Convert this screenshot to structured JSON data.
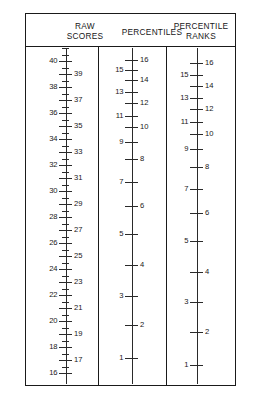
{
  "headers": {
    "raw_scores": "RAW\nSCORES",
    "raw_scores_line1": "RAW",
    "raw_scores_line2": "SCORES",
    "percentiles": "PERCENTILES",
    "percentile_ranks_line1": "PERCENTILE",
    "percentile_ranks_line2": "RANKS"
  },
  "colors": {
    "ink": "#1a1a1a",
    "axis": "#2a2a2a",
    "paper": "#ffffff"
  },
  "chart_data": {
    "type": "table",
    "xlabel": "",
    "ylabel": "",
    "grid": false,
    "legend": "none",
    "scales": [
      {
        "name": "RAW SCORES",
        "axis_x": 39.6,
        "spacing": "linear",
        "range": [
          16,
          40
        ],
        "ticks": [
          {
            "label": "40",
            "y": 60,
            "side": "left",
            "size": "major"
          },
          {
            "label": "",
            "y": 47,
            "side": "none",
            "size": "minor"
          },
          {
            "label": "39",
            "y": 73,
            "side": "right",
            "size": "major"
          },
          {
            "label": "38",
            "y": 86,
            "side": "left",
            "size": "major"
          },
          {
            "label": "37",
            "y": 99,
            "side": "right",
            "size": "major"
          },
          {
            "label": "36",
            "y": 112,
            "side": "left",
            "size": "major"
          },
          {
            "label": "35",
            "y": 125,
            "side": "right",
            "size": "major"
          },
          {
            "label": "34",
            "y": 138,
            "side": "left",
            "size": "major"
          },
          {
            "label": "33",
            "y": 151,
            "side": "right",
            "size": "major"
          },
          {
            "label": "32",
            "y": 164,
            "side": "left",
            "size": "major"
          },
          {
            "label": "31",
            "y": 177,
            "side": "right",
            "size": "major"
          },
          {
            "label": "30",
            "y": 190,
            "side": "left",
            "size": "major"
          },
          {
            "label": "29",
            "y": 203,
            "side": "right",
            "size": "major"
          },
          {
            "label": "28",
            "y": 216,
            "side": "left",
            "size": "major"
          },
          {
            "label": "27",
            "y": 229,
            "side": "right",
            "size": "major"
          },
          {
            "label": "26",
            "y": 242,
            "side": "left",
            "size": "major"
          },
          {
            "label": "25",
            "y": 255,
            "side": "right",
            "size": "major"
          },
          {
            "label": "24",
            "y": 268,
            "side": "left",
            "size": "major"
          },
          {
            "label": "23",
            "y": 281,
            "side": "right",
            "size": "major"
          },
          {
            "label": "22",
            "y": 294,
            "side": "left",
            "size": "major"
          },
          {
            "label": "21",
            "y": 307,
            "side": "right",
            "size": "major"
          },
          {
            "label": "20",
            "y": 320,
            "side": "left",
            "size": "major"
          },
          {
            "label": "19",
            "y": 333,
            "side": "right",
            "size": "major"
          },
          {
            "label": "18",
            "y": 346,
            "side": "left",
            "size": "major"
          },
          {
            "label": "17",
            "y": 359,
            "side": "right",
            "size": "major"
          },
          {
            "label": "16",
            "y": 372,
            "side": "left",
            "size": "major"
          }
        ]
      },
      {
        "name": "PERCENTILES",
        "axis_x": 105.6,
        "spacing": "nonlinear",
        "range": [
          1,
          16
        ],
        "ticks": [
          {
            "label": "16",
            "y": 59,
            "side": "right",
            "size": "major"
          },
          {
            "label": "15",
            "y": 69,
            "side": "left",
            "size": "major"
          },
          {
            "label": "14",
            "y": 79,
            "side": "right",
            "size": "major"
          },
          {
            "label": "13",
            "y": 91,
            "side": "left",
            "size": "major"
          },
          {
            "label": "12",
            "y": 102,
            "side": "right",
            "size": "major"
          },
          {
            "label": "11",
            "y": 115,
            "side": "left",
            "size": "major"
          },
          {
            "label": "10",
            "y": 126,
            "side": "right",
            "size": "major"
          },
          {
            "label": "9",
            "y": 141,
            "side": "left",
            "size": "major"
          },
          {
            "label": "8",
            "y": 158,
            "side": "right",
            "size": "major"
          },
          {
            "label": "7",
            "y": 181,
            "side": "left",
            "size": "major"
          },
          {
            "label": "6",
            "y": 205,
            "side": "right",
            "size": "major"
          },
          {
            "label": "5",
            "y": 233,
            "side": "left",
            "size": "major"
          },
          {
            "label": "4",
            "y": 264,
            "side": "right",
            "size": "major"
          },
          {
            "label": "3",
            "y": 295,
            "side": "left",
            "size": "major"
          },
          {
            "label": "2",
            "y": 324,
            "side": "right",
            "size": "major"
          },
          {
            "label": "1",
            "y": 357,
            "side": "left",
            "size": "major"
          }
        ]
      },
      {
        "name": "PERCENTILE RANKS",
        "axis_x": 170.6,
        "spacing": "nonlinear",
        "range": [
          1,
          16
        ],
        "ticks": [
          {
            "label": "16",
            "y": 62,
            "side": "right",
            "size": "major"
          },
          {
            "label": "15",
            "y": 74,
            "side": "left",
            "size": "major"
          },
          {
            "label": "14",
            "y": 85,
            "side": "right",
            "size": "major"
          },
          {
            "label": "13",
            "y": 97,
            "side": "left",
            "size": "major"
          },
          {
            "label": "12",
            "y": 108,
            "side": "right",
            "size": "major"
          },
          {
            "label": "11",
            "y": 121,
            "side": "left",
            "size": "major"
          },
          {
            "label": "10",
            "y": 133,
            "side": "right",
            "size": "major"
          },
          {
            "label": "9",
            "y": 148,
            "side": "left",
            "size": "major"
          },
          {
            "label": "8",
            "y": 166,
            "side": "right",
            "size": "major"
          },
          {
            "label": "7",
            "y": 188,
            "side": "left",
            "size": "major"
          },
          {
            "label": "6",
            "y": 212,
            "side": "right",
            "size": "major"
          },
          {
            "label": "5",
            "y": 240,
            "side": "left",
            "size": "major"
          },
          {
            "label": "4",
            "y": 271,
            "side": "right",
            "size": "major"
          },
          {
            "label": "3",
            "y": 301,
            "side": "left",
            "size": "major"
          },
          {
            "label": "2",
            "y": 331,
            "side": "right",
            "size": "major"
          },
          {
            "label": "1",
            "y": 364,
            "side": "left",
            "size": "major"
          }
        ]
      }
    ]
  }
}
